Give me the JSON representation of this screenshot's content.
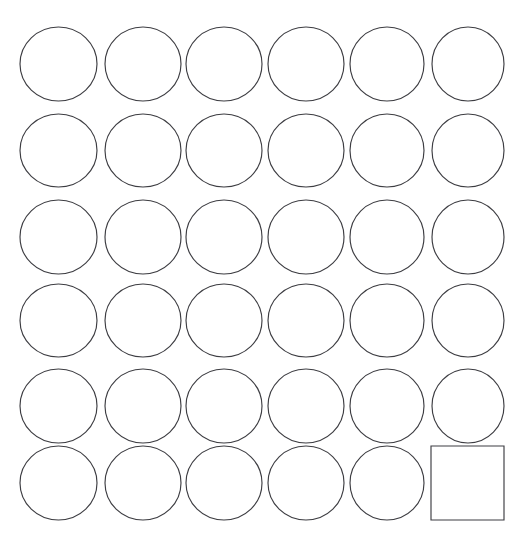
{
  "canvas": {
    "width": 519,
    "height": 550,
    "background_color": "#ffffff",
    "title": "Shape Grid"
  },
  "style": {
    "stroke_color": "#3d3d42",
    "stroke_width": 1.15,
    "fill": "none"
  },
  "grid": {
    "rows": 6,
    "columns": 6,
    "total_shapes": 36,
    "circle_count": 35,
    "square_count": 1,
    "origin_x": 20,
    "origin_y": 27,
    "column_step": 82.7,
    "row_step": 86.6,
    "cell_width": 77,
    "cell_height": 74
  },
  "shapes": [
    {
      "id": "shape-r1c1",
      "type": "circle",
      "row": 1,
      "col": 1,
      "cx": 58.5,
      "cy": 64.0,
      "rx": 38.5,
      "ry": 37.0
    },
    {
      "id": "shape-r1c2",
      "type": "circle",
      "row": 1,
      "col": 2,
      "cx": 143.0,
      "cy": 64.0,
      "rx": 38.0,
      "ry": 37.0
    },
    {
      "id": "shape-r1c3",
      "type": "circle",
      "row": 1,
      "col": 3,
      "cx": 224.0,
      "cy": 64.0,
      "rx": 38.0,
      "ry": 37.0
    },
    {
      "id": "shape-r1c4",
      "type": "circle",
      "row": 1,
      "col": 4,
      "cx": 306.0,
      "cy": 64.0,
      "rx": 38.0,
      "ry": 37.0
    },
    {
      "id": "shape-r1c5",
      "type": "circle",
      "row": 1,
      "col": 5,
      "cx": 387.0,
      "cy": 64.0,
      "rx": 37.0,
      "ry": 37.0
    },
    {
      "id": "shape-r1c6",
      "type": "circle",
      "row": 1,
      "col": 6,
      "cx": 468.0,
      "cy": 64.0,
      "rx": 36.0,
      "ry": 37.0
    },
    {
      "id": "shape-r2c1",
      "type": "circle",
      "row": 2,
      "col": 1,
      "cx": 58.5,
      "cy": 150.5,
      "rx": 38.5,
      "ry": 36.5
    },
    {
      "id": "shape-r2c2",
      "type": "circle",
      "row": 2,
      "col": 2,
      "cx": 143.0,
      "cy": 150.5,
      "rx": 38.0,
      "ry": 36.5
    },
    {
      "id": "shape-r2c3",
      "type": "circle",
      "row": 2,
      "col": 3,
      "cx": 224.0,
      "cy": 150.5,
      "rx": 38.0,
      "ry": 36.5
    },
    {
      "id": "shape-r2c4",
      "type": "circle",
      "row": 2,
      "col": 4,
      "cx": 306.0,
      "cy": 150.5,
      "rx": 38.0,
      "ry": 36.5
    },
    {
      "id": "shape-r2c5",
      "type": "circle",
      "row": 2,
      "col": 5,
      "cx": 387.0,
      "cy": 150.5,
      "rx": 37.0,
      "ry": 36.5
    },
    {
      "id": "shape-r2c6",
      "type": "circle",
      "row": 2,
      "col": 6,
      "cx": 468.0,
      "cy": 150.5,
      "rx": 36.0,
      "ry": 36.5
    },
    {
      "id": "shape-r3c1",
      "type": "circle",
      "row": 3,
      "col": 1,
      "cx": 58.5,
      "cy": 237.0,
      "rx": 38.5,
      "ry": 37.0
    },
    {
      "id": "shape-r3c2",
      "type": "circle",
      "row": 3,
      "col": 2,
      "cx": 143.0,
      "cy": 237.0,
      "rx": 38.0,
      "ry": 37.0
    },
    {
      "id": "shape-r3c3",
      "type": "circle",
      "row": 3,
      "col": 3,
      "cx": 224.0,
      "cy": 237.0,
      "rx": 38.0,
      "ry": 37.0
    },
    {
      "id": "shape-r3c4",
      "type": "circle",
      "row": 3,
      "col": 4,
      "cx": 306.0,
      "cy": 237.0,
      "rx": 38.0,
      "ry": 37.0
    },
    {
      "id": "shape-r3c5",
      "type": "circle",
      "row": 3,
      "col": 5,
      "cx": 387.0,
      "cy": 237.0,
      "rx": 37.0,
      "ry": 37.0
    },
    {
      "id": "shape-r3c6",
      "type": "circle",
      "row": 3,
      "col": 6,
      "cx": 468.0,
      "cy": 237.0,
      "rx": 36.0,
      "ry": 37.0
    },
    {
      "id": "shape-r4c1",
      "type": "circle",
      "row": 4,
      "col": 1,
      "cx": 58.5,
      "cy": 320.5,
      "rx": 38.5,
      "ry": 36.5
    },
    {
      "id": "shape-r4c2",
      "type": "circle",
      "row": 4,
      "col": 2,
      "cx": 143.0,
      "cy": 320.5,
      "rx": 38.0,
      "ry": 36.5
    },
    {
      "id": "shape-r4c3",
      "type": "circle",
      "row": 4,
      "col": 3,
      "cx": 224.0,
      "cy": 320.5,
      "rx": 38.0,
      "ry": 36.5
    },
    {
      "id": "shape-r4c4",
      "type": "circle",
      "row": 4,
      "col": 4,
      "cx": 306.0,
      "cy": 320.5,
      "rx": 38.0,
      "ry": 36.5
    },
    {
      "id": "shape-r4c5",
      "type": "circle",
      "row": 4,
      "col": 5,
      "cx": 387.0,
      "cy": 320.5,
      "rx": 37.0,
      "ry": 36.5
    },
    {
      "id": "shape-r4c6",
      "type": "circle",
      "row": 4,
      "col": 6,
      "cx": 468.0,
      "cy": 320.5,
      "rx": 36.0,
      "ry": 36.5
    },
    {
      "id": "shape-r5c1",
      "type": "circle",
      "row": 5,
      "col": 1,
      "cx": 58.5,
      "cy": 406.0,
      "rx": 38.5,
      "ry": 37.0
    },
    {
      "id": "shape-r5c2",
      "type": "circle",
      "row": 5,
      "col": 2,
      "cx": 143.0,
      "cy": 406.0,
      "rx": 38.0,
      "ry": 37.0
    },
    {
      "id": "shape-r5c3",
      "type": "circle",
      "row": 5,
      "col": 3,
      "cx": 224.0,
      "cy": 406.0,
      "rx": 38.0,
      "ry": 37.0
    },
    {
      "id": "shape-r5c4",
      "type": "circle",
      "row": 5,
      "col": 4,
      "cx": 306.0,
      "cy": 406.0,
      "rx": 38.0,
      "ry": 37.0
    },
    {
      "id": "shape-r5c5",
      "type": "circle",
      "row": 5,
      "col": 5,
      "cx": 387.0,
      "cy": 406.0,
      "rx": 37.0,
      "ry": 37.0
    },
    {
      "id": "shape-r5c6",
      "type": "circle",
      "row": 5,
      "col": 6,
      "cx": 468.0,
      "cy": 406.0,
      "rx": 36.0,
      "ry": 37.0
    },
    {
      "id": "shape-r6c1",
      "type": "circle",
      "row": 6,
      "col": 1,
      "cx": 58.5,
      "cy": 483.0,
      "rx": 38.5,
      "ry": 37.0
    },
    {
      "id": "shape-r6c2",
      "type": "circle",
      "row": 6,
      "col": 2,
      "cx": 143.0,
      "cy": 483.0,
      "rx": 38.0,
      "ry": 37.0
    },
    {
      "id": "shape-r6c3",
      "type": "circle",
      "row": 6,
      "col": 3,
      "cx": 224.0,
      "cy": 483.0,
      "rx": 38.0,
      "ry": 37.0
    },
    {
      "id": "shape-r6c4",
      "type": "circle",
      "row": 6,
      "col": 4,
      "cx": 306.0,
      "cy": 483.0,
      "rx": 38.0,
      "ry": 37.0
    },
    {
      "id": "shape-r6c5",
      "type": "circle",
      "row": 6,
      "col": 5,
      "cx": 387.0,
      "cy": 483.0,
      "rx": 37.0,
      "ry": 37.0
    },
    {
      "id": "shape-r6c6",
      "type": "square",
      "row": 6,
      "col": 6,
      "x": 431.0,
      "y": 446.0,
      "width": 73.0,
      "height": 74.0
    }
  ]
}
